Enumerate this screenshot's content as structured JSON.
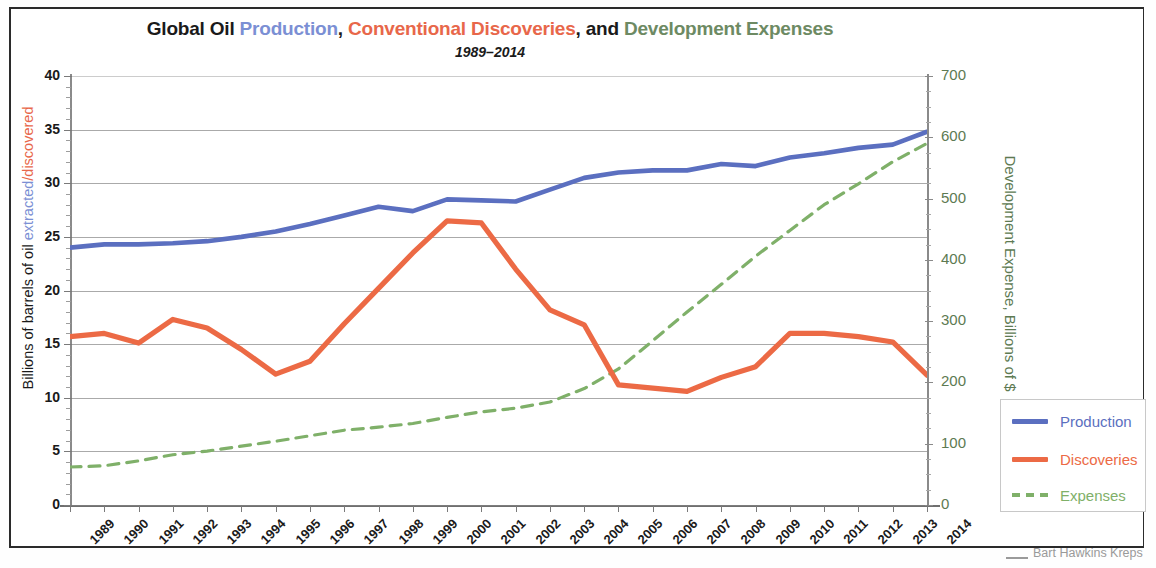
{
  "title": {
    "segments": [
      {
        "text": "Global Oil ",
        "color_role": "black"
      },
      {
        "text": "Production",
        "color_role": "blue"
      },
      {
        "text": ", ",
        "color_role": "black"
      },
      {
        "text": "Conventional Discoveries",
        "color_role": "red"
      },
      {
        "text": ", and ",
        "color_role": "black"
      },
      {
        "text": "Development Expenses",
        "color_role": "green"
      }
    ],
    "full": "Global Oil Production, Conventional Discoveries, and Development Expenses",
    "subtitle": "1989–2014"
  },
  "axis_titles": {
    "left_prefix": "Billions of barrels of oil ",
    "left_extracted": "extracted",
    "left_slash": "/",
    "left_discovered": "discovered",
    "left_full": "Billions of barrels of oil extracted/discovered",
    "right": "Development Expense, Billions of $"
  },
  "legend": {
    "items": [
      {
        "label": "Production",
        "color": "#5b6fc0",
        "style": "solid"
      },
      {
        "label": "Discoveries",
        "color": "#ec6a45",
        "style": "solid"
      },
      {
        "label": "Expenses",
        "color": "#7fb069",
        "style": "dashed"
      }
    ]
  },
  "attribution": "Bart Hawkins Kreps",
  "colors": {
    "production": "#5b6fc0",
    "discoveries": "#ec6a45",
    "expenses": "#7fb069",
    "title_blue": "#7b8fd4",
    "title_red": "#e8674a",
    "title_green": "#6d8a63",
    "grid": "#8d8d8d",
    "axis": "#7a7a7a",
    "frame": "#2b2b2b",
    "right_axis_text": "#5d7a52"
  },
  "chart_data": {
    "type": "line",
    "title": "Global Oil Production, Conventional Discoveries, and Development Expenses",
    "subtitle": "1989–2014",
    "xlabel": "",
    "ylabel": "Billions of barrels of oil extracted/discovered",
    "y2label": "Development Expense, Billions of $",
    "x": [
      1989,
      1990,
      1991,
      1992,
      1993,
      1994,
      1995,
      1996,
      1997,
      1998,
      1999,
      2000,
      2001,
      2002,
      2003,
      2004,
      2005,
      2006,
      2007,
      2008,
      2009,
      2010,
      2011,
      2012,
      2013,
      2014
    ],
    "xtick_labels": [
      "1989",
      "1990",
      "1991",
      "1992",
      "1993",
      "1994",
      "1995",
      "1996",
      "1997",
      "1998",
      "1999",
      "2000",
      "2001",
      "2002",
      "2003",
      "2004",
      "2005",
      "2006",
      "2007",
      "2008",
      "2009",
      "2010",
      "2011",
      "2012",
      "2013",
      "2014"
    ],
    "ylim": [
      0,
      40
    ],
    "yticks": [
      0,
      5,
      10,
      15,
      20,
      25,
      30,
      35,
      40
    ],
    "ytick_labels": [
      "0",
      "5",
      "10",
      "15",
      "20",
      "25",
      "30",
      "35",
      "40"
    ],
    "y2lim": [
      0,
      700
    ],
    "y2ticks": [
      0,
      100,
      200,
      300,
      400,
      500,
      600,
      700
    ],
    "y2tick_labels": [
      "0",
      "100",
      "200",
      "300",
      "400",
      "500",
      "600",
      "700"
    ],
    "grid": true,
    "legend_position": "right",
    "series": [
      {
        "name": "Production",
        "axis": "left",
        "color": "#5b6fc0",
        "style": "solid",
        "values": [
          24.0,
          24.3,
          24.3,
          24.4,
          24.6,
          25.0,
          25.5,
          26.2,
          27.0,
          27.8,
          27.4,
          28.5,
          28.4,
          28.3,
          29.4,
          30.5,
          31.0,
          31.2,
          31.2,
          31.8,
          31.6,
          32.4,
          32.8,
          33.3,
          33.6,
          34.8
        ]
      },
      {
        "name": "Discoveries",
        "axis": "left",
        "color": "#ec6a45",
        "style": "solid",
        "values": [
          15.7,
          16.0,
          15.1,
          17.3,
          16.5,
          14.5,
          12.2,
          13.4,
          16.9,
          20.2,
          23.5,
          26.5,
          26.3,
          22.0,
          18.2,
          16.8,
          11.2,
          10.9,
          10.6,
          11.9,
          12.9,
          16.0,
          16.0,
          15.7,
          15.2,
          12.1
        ]
      },
      {
        "name": "Expenses",
        "axis": "right",
        "color": "#7fb069",
        "style": "dashed",
        "values": [
          62,
          64,
          72,
          82,
          88,
          96,
          104,
          113,
          122,
          127,
          133,
          143,
          152,
          158,
          168,
          190,
          222,
          268,
          315,
          360,
          406,
          448,
          490,
          524,
          560,
          590
        ]
      }
    ]
  }
}
